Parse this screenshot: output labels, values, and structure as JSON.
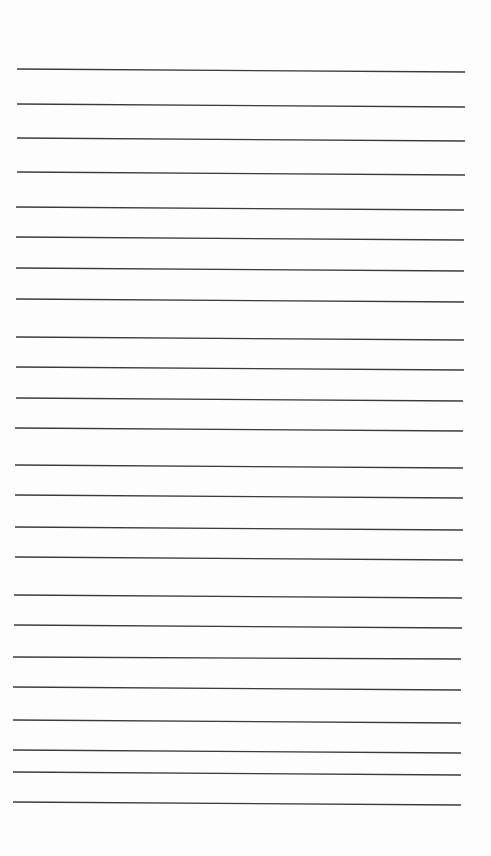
{
  "document": {
    "type": "lined-paper",
    "background_color": "#fdfdfd",
    "line_color": "#3a3a3a",
    "line_count": 24,
    "lines": [
      {
        "x1": 17,
        "y1": 69,
        "x2": 465,
        "y2": 72
      },
      {
        "x1": 17,
        "y1": 104,
        "x2": 465,
        "y2": 107
      },
      {
        "x1": 17,
        "y1": 138,
        "x2": 465,
        "y2": 141
      },
      {
        "x1": 17,
        "y1": 172,
        "x2": 465,
        "y2": 175
      },
      {
        "x1": 16,
        "y1": 207,
        "x2": 464,
        "y2": 210
      },
      {
        "x1": 16,
        "y1": 237,
        "x2": 464,
        "y2": 240
      },
      {
        "x1": 16,
        "y1": 268,
        "x2": 464,
        "y2": 271
      },
      {
        "x1": 16,
        "y1": 299,
        "x2": 464,
        "y2": 302
      },
      {
        "x1": 16,
        "y1": 337,
        "x2": 464,
        "y2": 340
      },
      {
        "x1": 16,
        "y1": 367,
        "x2": 464,
        "y2": 370
      },
      {
        "x1": 16,
        "y1": 398,
        "x2": 463,
        "y2": 401
      },
      {
        "x1": 15,
        "y1": 428,
        "x2": 463,
        "y2": 431
      },
      {
        "x1": 15,
        "y1": 465,
        "x2": 463,
        "y2": 468
      },
      {
        "x1": 15,
        "y1": 495,
        "x2": 463,
        "y2": 498
      },
      {
        "x1": 15,
        "y1": 527,
        "x2": 463,
        "y2": 530
      },
      {
        "x1": 15,
        "y1": 557,
        "x2": 463,
        "y2": 560
      },
      {
        "x1": 14,
        "y1": 595,
        "x2": 462,
        "y2": 598
      },
      {
        "x1": 14,
        "y1": 625,
        "x2": 462,
        "y2": 628
      },
      {
        "x1": 13,
        "y1": 657,
        "x2": 461,
        "y2": 659
      },
      {
        "x1": 13,
        "y1": 687,
        "x2": 461,
        "y2": 690
      },
      {
        "x1": 13,
        "y1": 720,
        "x2": 461,
        "y2": 723
      },
      {
        "x1": 13,
        "y1": 750,
        "x2": 461,
        "y2": 753
      },
      {
        "x1": 13,
        "y1": 772,
        "x2": 461,
        "y2": 775
      },
      {
        "x1": 13,
        "y1": 802,
        "x2": 461,
        "y2": 805
      }
    ]
  }
}
